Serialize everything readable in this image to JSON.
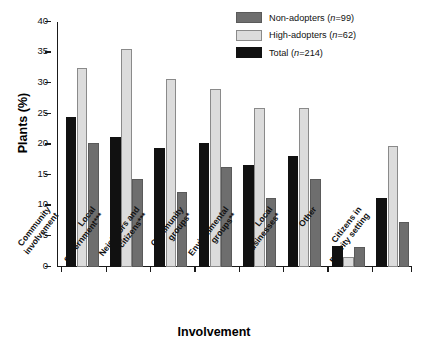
{
  "chart_data": {
    "type": "bar",
    "title": "",
    "xlabel": "Involvement",
    "ylabel": "Plants (%)",
    "ylim": [
      0,
      40
    ],
    "yticks": [
      0,
      5,
      10,
      15,
      20,
      25,
      30,
      35,
      40
    ],
    "grid": false,
    "legend_position": "top-right",
    "categories": [
      "Community involvement",
      "Local government***",
      "Neighbors and citizens***",
      "Community groups*",
      "Environmental groups**",
      "Local businesses*",
      "Other",
      "Citizens in priority setting"
    ],
    "category_lines": [
      [
        "Community",
        "involvement"
      ],
      [
        "Local",
        "government***"
      ],
      [
        "Neighbors and",
        "citizens***"
      ],
      [
        "Community",
        "groups*"
      ],
      [
        "Environmental",
        "groups**"
      ],
      [
        "Local",
        "businesses*"
      ],
      [
        "Other"
      ],
      [
        "Citizens in",
        "priority setting"
      ]
    ],
    "series": [
      {
        "name": "Total (n=214)",
        "key": "total",
        "color": "#111111",
        "values": [
          24.5,
          21.2,
          19.4,
          20.3,
          16.7,
          18.1,
          3.5,
          11.3
        ]
      },
      {
        "name": "High-adopters (n=62)",
        "key": "high",
        "color": "#dcdcdc",
        "values": [
          32.5,
          35.6,
          30.7,
          29.1,
          26.0,
          26.0,
          1.7,
          19.8
        ]
      },
      {
        "name": "Non-adopters (n=99)",
        "key": "non",
        "color": "#6e6e6e",
        "values": [
          20.3,
          14.4,
          12.3,
          16.3,
          11.3,
          14.3,
          3.2,
          7.3
        ]
      }
    ]
  },
  "legend": {
    "items": [
      {
        "label": "Non-adopters (n=99)",
        "swatch": "non"
      },
      {
        "label": "High-adopters (n=62)",
        "swatch": "high"
      },
      {
        "label": "Total (n=214)",
        "swatch": "total"
      }
    ]
  },
  "axes": {
    "y_title": "Plants (%)",
    "x_title": "Involvement"
  }
}
